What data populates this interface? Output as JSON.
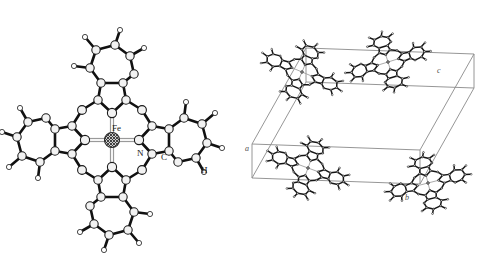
{
  "figure": {
    "background_color": "#ffffff",
    "width": 481,
    "height": 262,
    "panels": [
      {
        "id": "molecule",
        "name": "iron-phthalocyanine-molecule",
        "description": "Ball-and-stick molecular structure of iron phthalocyanine viewed face-on"
      },
      {
        "id": "packing",
        "name": "crystal-packing-unit-cell",
        "description": "Crystal packing diagram of iron phthalocyanine molecules inside an outlined unit cell"
      }
    ]
  },
  "molecule": {
    "labels": {
      "metal": "Fe",
      "nitrogen": "N",
      "carbon": "C",
      "hydrogen": "H"
    },
    "label_positions": {
      "metal": {
        "x": 112,
        "y": 131
      },
      "nitrogen": {
        "x": 137,
        "y": 156
      },
      "carbon": {
        "x": 161,
        "y": 160
      },
      "hydrogen": {
        "x": 201,
        "y": 173
      }
    },
    "colors": {
      "bond": "#111111",
      "atom_fill": "#f2f2f2",
      "atom_stroke": "#1a1a1a",
      "metal_fill": "#808080",
      "coordination_bond": "#9a9a9a",
      "label_text": "#1a1a1a"
    }
  },
  "packing": {
    "axis_labels": [
      {
        "label": "a",
        "x": 245,
        "y": 151
      },
      {
        "label": "b",
        "x": 405,
        "y": 200
      },
      {
        "label": "c",
        "x": 437,
        "y": 73
      }
    ],
    "colors": {
      "cell_edge": "#8a8a8a",
      "bond": "#151515",
      "atom_fill": "#f0f0f0",
      "atom_stroke": "#222222",
      "metal_fill": "#8c8c8c",
      "coordination_bond": "#a0a0a0",
      "label_text": "#4d4d4d"
    }
  }
}
